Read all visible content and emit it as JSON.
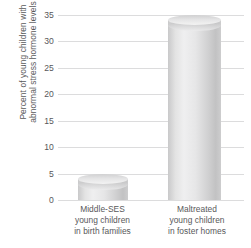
{
  "chart_data": {
    "type": "bar",
    "title": "",
    "subtitle": "",
    "xlabel": "",
    "ylabel": "Percent of young children with abnormal stress hormone levels",
    "ylabel_lines": [
      "Percent of young children with",
      "abnormal stress hormone levels"
    ],
    "categories": [
      "Middle-SES young children in birth families",
      "Maltreated young children in foster homes"
    ],
    "category_lines": [
      [
        "Middle-SES",
        "young children",
        "in birth families"
      ],
      [
        "Maltreated",
        "young children",
        "in foster homes"
      ]
    ],
    "values": [
      4,
      34
    ],
    "ylim": [
      0,
      35
    ],
    "yticks": [
      0,
      5,
      10,
      15,
      20,
      25,
      30,
      35
    ],
    "ytick_labels": [
      "0",
      "5",
      "10",
      "15",
      "20",
      "25",
      "30",
      "35"
    ],
    "grid": true,
    "grid_axis": "y",
    "legend": false,
    "legend_position": "none",
    "bar_style": "cylinder-3d",
    "colors": {
      "bar_light": "#efeff0",
      "bar_mid": "#d2d2d3",
      "bar_dark": "#c2c2c3",
      "gridline": "#dcdcdd",
      "text": "#58585a",
      "background": "#ffffff"
    }
  }
}
